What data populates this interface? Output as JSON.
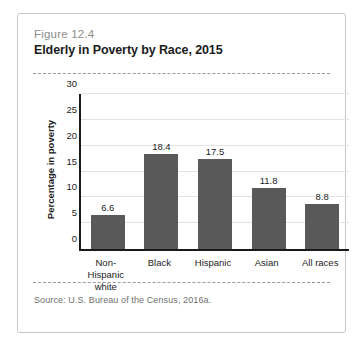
{
  "card": {
    "figure_number": "Figure 12.4",
    "title": "Elderly in Poverty by Race, 2015",
    "source": "Source: U.S. Bureau of the Census, 2016a."
  },
  "chart_data": {
    "type": "bar",
    "title": "Elderly in Poverty by Race, 2015",
    "xlabel": "",
    "ylabel": "Percentage in poverty",
    "categories": [
      "Non-Hispanic white",
      "Black",
      "Hispanic",
      "Asian",
      "All races"
    ],
    "category_lines": [
      [
        "Non-Hispanic",
        "white"
      ],
      [
        "Black"
      ],
      [
        "Hispanic"
      ],
      [
        "Asian"
      ],
      [
        "All races"
      ]
    ],
    "values": [
      6.6,
      18.4,
      17.5,
      11.8,
      8.8
    ],
    "value_labels": [
      "6.6",
      "18.4",
      "17.5",
      "11.8",
      "8.8"
    ],
    "ylim": [
      0,
      30
    ],
    "yticks": [
      0,
      5,
      10,
      15,
      20,
      25,
      30
    ],
    "ytick_labels": [
      "0",
      "5",
      "10",
      "15",
      "20",
      "25",
      "30"
    ],
    "grid": true,
    "legend": false,
    "bar_color": "#595959",
    "axis_color": "#1a1a1a",
    "gridline_color": "#e3e3e3"
  }
}
